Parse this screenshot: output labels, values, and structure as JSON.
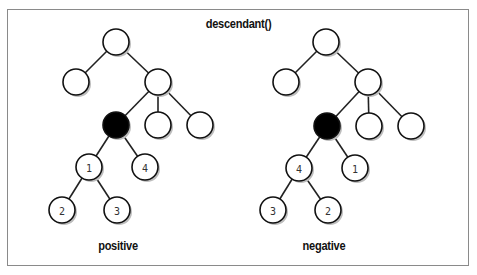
{
  "title": "descendant()",
  "diagrams": [
    {
      "caption": "positive",
      "nodes": [
        {
          "id": "root",
          "x": 116,
          "y": 42,
          "label": "",
          "filled": false
        },
        {
          "id": "a",
          "x": 76,
          "y": 82,
          "label": "",
          "filled": false
        },
        {
          "id": "b",
          "x": 158,
          "y": 82,
          "label": "",
          "filled": false
        },
        {
          "id": "ctx",
          "x": 116,
          "y": 125,
          "label": "",
          "filled": true
        },
        {
          "id": "c",
          "x": 158,
          "y": 125,
          "label": "",
          "filled": false
        },
        {
          "id": "d",
          "x": 200,
          "y": 125,
          "label": "",
          "filled": false
        },
        {
          "id": "n1",
          "x": 89,
          "y": 167,
          "label": "1",
          "filled": false
        },
        {
          "id": "n4",
          "x": 145,
          "y": 167,
          "label": "4",
          "filled": false
        },
        {
          "id": "n2",
          "x": 62,
          "y": 210,
          "label": "2",
          "filled": false
        },
        {
          "id": "n3",
          "x": 117,
          "y": 210,
          "label": "3",
          "filled": false
        }
      ],
      "edges": [
        [
          "root",
          "a"
        ],
        [
          "root",
          "b"
        ],
        [
          "b",
          "ctx"
        ],
        [
          "b",
          "c"
        ],
        [
          "b",
          "d"
        ],
        [
          "ctx",
          "n1"
        ],
        [
          "ctx",
          "n4"
        ],
        [
          "n1",
          "n2"
        ],
        [
          "n1",
          "n3"
        ]
      ]
    },
    {
      "caption": "negative",
      "nodes": [
        {
          "id": "root",
          "x": 326,
          "y": 42,
          "label": "",
          "filled": false
        },
        {
          "id": "a",
          "x": 286,
          "y": 82,
          "label": "",
          "filled": false
        },
        {
          "id": "b",
          "x": 368,
          "y": 82,
          "label": "",
          "filled": false
        },
        {
          "id": "ctx",
          "x": 327,
          "y": 126,
          "label": "",
          "filled": true
        },
        {
          "id": "c",
          "x": 369,
          "y": 126,
          "label": "",
          "filled": false
        },
        {
          "id": "d",
          "x": 411,
          "y": 126,
          "label": "",
          "filled": false
        },
        {
          "id": "n4",
          "x": 299,
          "y": 168,
          "label": "4",
          "filled": false
        },
        {
          "id": "n1",
          "x": 355,
          "y": 168,
          "label": "1",
          "filled": false
        },
        {
          "id": "n3",
          "x": 273,
          "y": 210,
          "label": "3",
          "filled": false
        },
        {
          "id": "n2",
          "x": 328,
          "y": 210,
          "label": "2",
          "filled": false
        }
      ],
      "edges": [
        [
          "root",
          "a"
        ],
        [
          "root",
          "b"
        ],
        [
          "b",
          "ctx"
        ],
        [
          "b",
          "c"
        ],
        [
          "b",
          "d"
        ],
        [
          "ctx",
          "n4"
        ],
        [
          "ctx",
          "n1"
        ],
        [
          "n4",
          "n3"
        ],
        [
          "n4",
          "n2"
        ]
      ]
    }
  ],
  "colors": {
    "filled": "#000000",
    "border": "#8a8a8a"
  }
}
